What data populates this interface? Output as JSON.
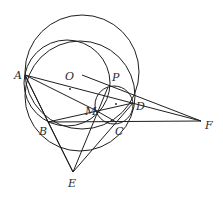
{
  "diagram": {
    "type": "geometry",
    "points": {
      "A": {
        "label": "A",
        "x": 25,
        "y": 75,
        "lx": 14,
        "ly": 79
      },
      "B": {
        "label": "B",
        "x": 48,
        "y": 122,
        "lx": 39,
        "ly": 135
      },
      "C": {
        "label": "C",
        "x": 116,
        "y": 122,
        "lx": 115,
        "ly": 135
      },
      "D": {
        "label": "D",
        "x": 133,
        "y": 103,
        "lx": 136,
        "ly": 110
      },
      "E": {
        "label": "E",
        "x": 73,
        "y": 172,
        "lx": 68,
        "ly": 187
      },
      "F": {
        "label": "F",
        "x": 201,
        "y": 121,
        "lx": 205,
        "ly": 129
      },
      "M": {
        "label": "M",
        "x": 97,
        "y": 111,
        "lx": 85,
        "ly": 115
      },
      "O": {
        "label": "O",
        "x": 67,
        "y": 83,
        "lx": 65,
        "ly": 80
      },
      "P": {
        "label": "P",
        "x": 108,
        "y": 87,
        "lx": 112,
        "ly": 81
      }
    },
    "circles": [
      {
        "name": "big-circle",
        "cx": 82,
        "cy": 72,
        "r": 57
      },
      {
        "name": "circle-O",
        "cx": 67,
        "cy": 83,
        "r": 43
      },
      {
        "name": "circle-ABC",
        "cx": 80,
        "cy": 96,
        "r": 55
      },
      {
        "name": "small-circle-MPDC",
        "cx": 114,
        "cy": 105,
        "r": 19
      }
    ],
    "segments": [
      [
        "A",
        "F"
      ],
      [
        "A",
        "M"
      ],
      [
        "A",
        "B"
      ],
      [
        "A",
        "E"
      ],
      [
        "B",
        "D"
      ],
      [
        "B",
        "F"
      ],
      [
        "B",
        "E"
      ],
      [
        "E",
        "P"
      ],
      [
        "E",
        "D"
      ],
      [
        "M",
        "C"
      ],
      [
        "O",
        "F"
      ]
    ]
  }
}
